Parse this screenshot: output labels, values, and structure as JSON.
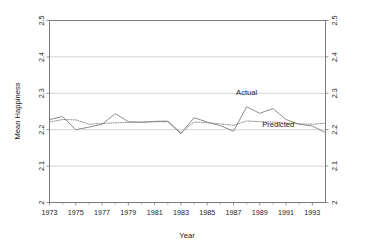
{
  "chart_data": {
    "type": "line",
    "title": "",
    "xlabel": "Year",
    "ylabel": "Mean Happiness",
    "xlim": [
      1973,
      1994
    ],
    "ylim": [
      2.0,
      2.5
    ],
    "grid": true,
    "legend_position": "inline-annotations",
    "x_tick_labels": [
      "1973",
      "1975",
      "1977",
      "1979",
      "1981",
      "1983",
      "1985",
      "1987",
      "1989",
      "1991",
      "1993"
    ],
    "x_ticks": [
      1973,
      1975,
      1977,
      1979,
      1981,
      1983,
      1985,
      1987,
      1989,
      1991,
      1993
    ],
    "y_tick_labels": [
      "2",
      "2.1",
      "2.2",
      "2.3",
      "2.4",
      "2.5"
    ],
    "y_ticks": [
      2.0,
      2.1,
      2.2,
      2.3,
      2.4,
      2.5
    ],
    "y_tick_labels_right": [
      "2",
      "2.1",
      "2.2",
      "2.3",
      "2.4",
      "2.5"
    ],
    "x": [
      1973,
      1974,
      1975,
      1976,
      1977,
      1978,
      1979,
      1980,
      1981,
      1982,
      1983,
      1984,
      1985,
      1986,
      1987,
      1988,
      1989,
      1990,
      1991,
      1992,
      1993,
      1994
    ],
    "series": [
      {
        "name": "Actual",
        "style": "solid",
        "color": "#808080",
        "values": [
          2.228,
          2.236,
          2.2,
          2.207,
          2.215,
          2.244,
          2.222,
          2.22,
          2.222,
          2.222,
          2.189,
          2.233,
          2.221,
          2.211,
          2.196,
          2.263,
          2.245,
          2.258,
          2.228,
          2.215,
          2.21,
          2.192
        ]
      },
      {
        "name": "Predicted",
        "style": "dotted",
        "color": "#808080",
        "values": [
          2.221,
          2.228,
          2.227,
          2.215,
          2.217,
          2.219,
          2.22,
          2.221,
          2.223,
          2.224,
          2.192,
          2.221,
          2.219,
          2.216,
          2.212,
          2.224,
          2.222,
          2.221,
          2.218,
          2.216,
          2.215,
          2.218
        ]
      }
    ],
    "annotations": [
      {
        "text": "Actual",
        "x": 1988.0,
        "y": 2.295
      },
      {
        "text": "Predicted",
        "x": 1990.4,
        "y": 2.207
      }
    ],
    "colors": {
      "axis": "#7a7a7a",
      "grid": "#c8c8c8",
      "line": "#8a8a8a",
      "text": "#1a1a1a",
      "background": "#ffffff"
    }
  }
}
